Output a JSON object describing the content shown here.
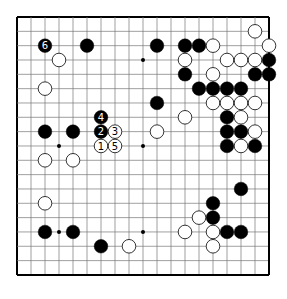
{
  "diagram": {
    "type": "go-board",
    "size": 19,
    "colors": {
      "background": "#ffffff",
      "line": "#777777",
      "border": "#000000",
      "black": "#000000",
      "white": "#ffffff"
    },
    "hoshi": [
      [
        3,
        3
      ],
      [
        9,
        3
      ],
      [
        15,
        3
      ],
      [
        3,
        9
      ],
      [
        9,
        9
      ],
      [
        15,
        9
      ],
      [
        3,
        15
      ],
      [
        9,
        15
      ],
      [
        15,
        15
      ]
    ],
    "black_stones": [
      {
        "x": 2,
        "y": 2,
        "label": "6"
      },
      {
        "x": 5,
        "y": 2
      },
      {
        "x": 10,
        "y": 2
      },
      {
        "x": 12,
        "y": 2
      },
      {
        "x": 13,
        "y": 2
      },
      {
        "x": 18,
        "y": 3
      },
      {
        "x": 12,
        "y": 4
      },
      {
        "x": 17,
        "y": 4
      },
      {
        "x": 18,
        "y": 4
      },
      {
        "x": 13,
        "y": 5
      },
      {
        "x": 14,
        "y": 5
      },
      {
        "x": 15,
        "y": 5
      },
      {
        "x": 16,
        "y": 5
      },
      {
        "x": 10,
        "y": 6
      },
      {
        "x": 6,
        "y": 7,
        "label": "4"
      },
      {
        "x": 15,
        "y": 7
      },
      {
        "x": 2,
        "y": 8
      },
      {
        "x": 4,
        "y": 8
      },
      {
        "x": 6,
        "y": 8,
        "label": "2"
      },
      {
        "x": 15,
        "y": 8
      },
      {
        "x": 16,
        "y": 8
      },
      {
        "x": 15,
        "y": 9
      },
      {
        "x": 17,
        "y": 9
      },
      {
        "x": 16,
        "y": 12
      },
      {
        "x": 14,
        "y": 13
      },
      {
        "x": 14,
        "y": 14
      },
      {
        "x": 2,
        "y": 15
      },
      {
        "x": 4,
        "y": 15
      },
      {
        "x": 15,
        "y": 15
      },
      {
        "x": 16,
        "y": 15
      },
      {
        "x": 6,
        "y": 16
      }
    ],
    "white_stones": [
      {
        "x": 17,
        "y": 1
      },
      {
        "x": 14,
        "y": 2
      },
      {
        "x": 18,
        "y": 2
      },
      {
        "x": 3,
        "y": 3
      },
      {
        "x": 12,
        "y": 3
      },
      {
        "x": 15,
        "y": 3
      },
      {
        "x": 16,
        "y": 3
      },
      {
        "x": 17,
        "y": 3
      },
      {
        "x": 14,
        "y": 4
      },
      {
        "x": 2,
        "y": 5
      },
      {
        "x": 14,
        "y": 6
      },
      {
        "x": 15,
        "y": 6
      },
      {
        "x": 16,
        "y": 6
      },
      {
        "x": 17,
        "y": 6
      },
      {
        "x": 12,
        "y": 7
      },
      {
        "x": 16,
        "y": 7
      },
      {
        "x": 7,
        "y": 8,
        "label": "3"
      },
      {
        "x": 10,
        "y": 8
      },
      {
        "x": 17,
        "y": 8
      },
      {
        "x": 6,
        "y": 9,
        "label": "1"
      },
      {
        "x": 7,
        "y": 9,
        "label": "5"
      },
      {
        "x": 16,
        "y": 9
      },
      {
        "x": 2,
        "y": 10
      },
      {
        "x": 4,
        "y": 10
      },
      {
        "x": 2,
        "y": 13
      },
      {
        "x": 13,
        "y": 14
      },
      {
        "x": 12,
        "y": 15
      },
      {
        "x": 14,
        "y": 15
      },
      {
        "x": 8,
        "y": 16
      },
      {
        "x": 14,
        "y": 16
      }
    ]
  }
}
